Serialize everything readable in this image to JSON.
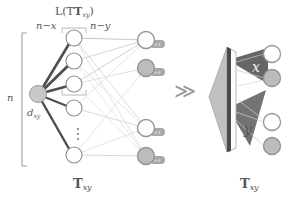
{
  "figure": {
    "title_label": "L(T_xy)",
    "labels": {
      "L_of_T": "L(Tₓᵧ)",
      "L_of_T_plain": "L(T",
      "L_sub": "xy",
      "n_minus_x": "n−x",
      "n_minus_y": "n−y",
      "n": "n",
      "d_xy_base": "d",
      "d_xy_sub": "xy",
      "caption_left_base": "T",
      "caption_left_sub": "xy",
      "caption_right_base": "T",
      "caption_right_sub": "xy",
      "cone_x": "x",
      "cone_y": "y",
      "arrow": "≫",
      "vertical_ellipsis": "⋮"
    },
    "colors": {
      "background": "#ffffff",
      "text": "#555555",
      "hub_node_fill": "#c8c8c8",
      "white_node_fill": "#ffffff",
      "gray_node_fill": "#bcbcbc",
      "node_stroke": "#8c8c8c",
      "badge_fill": "#a8a8a8",
      "edge_dark": "#4f4f4f",
      "edge_light": "#cfcfcf",
      "bracket": "#9a9a9a",
      "prism_side": "#b8b8b8",
      "prism_front": "#fbfbfb",
      "prism_edge": "#4a4a4a",
      "cone_fill": "#666666",
      "arrow_color": "#9a9a9a"
    },
    "left_panel": {
      "caption": "T_xy",
      "hub_node": {
        "id": "hub",
        "label": "d_xy",
        "fill": "gray",
        "cx": 38,
        "cy": 94
      },
      "middle_nodes": [
        {
          "id": "m1",
          "fill": "white",
          "cx": 74,
          "cy": 38
        },
        {
          "id": "m2",
          "fill": "white",
          "cx": 74,
          "cy": 61
        },
        {
          "id": "m3",
          "fill": "white",
          "cx": 74,
          "cy": 84
        },
        {
          "id": "m4",
          "fill": "white",
          "cx": 74,
          "cy": 108
        },
        {
          "id": "m5",
          "fill": "white",
          "cx": 74,
          "cy": 155
        }
      ],
      "right_nodes": [
        {
          "id": "r1",
          "fill": "white",
          "cx": 146,
          "cy": 40,
          "badge": "n-1"
        },
        {
          "id": "r2",
          "fill": "gray",
          "cx": 146,
          "cy": 68,
          "badge": "n-1"
        },
        {
          "id": "r3",
          "fill": "white",
          "cx": 146,
          "cy": 128,
          "badge": "n-1"
        },
        {
          "id": "r4",
          "fill": "gray",
          "cx": 146,
          "cy": 156,
          "badge": "n-1"
        }
      ],
      "bracket_n": {
        "top": 33,
        "bottom": 166,
        "x": 22
      },
      "bracket_nx": {
        "left": 62,
        "right": 86,
        "top": 29,
        "bottom": 95
      },
      "ellipsis_between": [
        "m4",
        "m5"
      ]
    },
    "right_panel": {
      "caption": "T_xy",
      "nodes": [
        {
          "id": "p1",
          "fill": "white",
          "cx": 272,
          "cy": 54
        },
        {
          "id": "p2",
          "fill": "gray",
          "cx": 272,
          "cy": 78
        },
        {
          "id": "p3",
          "fill": "white",
          "cx": 272,
          "cy": 122
        },
        {
          "id": "p4",
          "fill": "gray",
          "cx": 272,
          "cy": 146
        }
      ],
      "cones": [
        {
          "label": "x",
          "apex_x": 232,
          "apex_y": 66
        },
        {
          "label": "y",
          "apex_x": 232,
          "apex_y": 112
        }
      ]
    }
  }
}
